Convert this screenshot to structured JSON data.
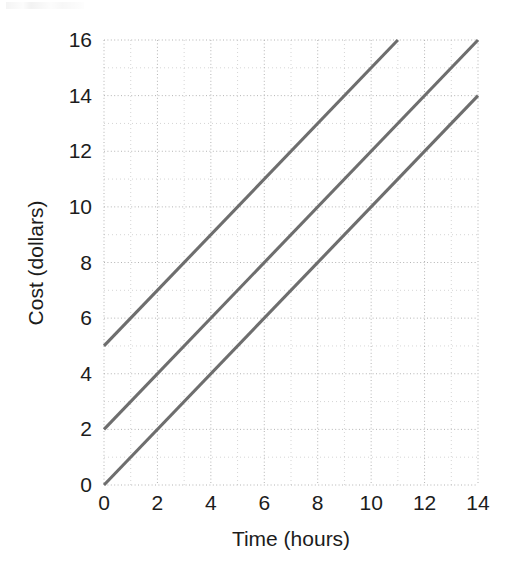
{
  "chart_data": {
    "type": "line",
    "title": "",
    "subtitle": "",
    "xlabel": "Time (hours)",
    "ylabel": "Cost (dollars)",
    "xlim": [
      0,
      14
    ],
    "ylim": [
      0,
      16
    ],
    "xticks": [
      0,
      2,
      4,
      6,
      8,
      10,
      12,
      14
    ],
    "yticks": [
      0,
      2,
      4,
      6,
      8,
      10,
      12,
      14,
      16
    ],
    "xtick_labels": [
      "0",
      "2",
      "4",
      "6",
      "8",
      "10",
      "12",
      "14"
    ],
    "ytick_labels": [
      "0",
      "2",
      "4",
      "6",
      "8",
      "10",
      "12",
      "14",
      "16"
    ],
    "grid": true,
    "grid_style": "dotted",
    "grid_minor_step_x": 1,
    "grid_minor_step_y": 1,
    "legend": false,
    "legend_position": "none",
    "line_color": "#6e6e6e",
    "grid_color": "#c9c9c9",
    "background": "#ffffff",
    "series": [
      {
        "name": "line-upper",
        "slope": 1,
        "intercept": 5,
        "x": [
          0,
          11
        ],
        "values": [
          5,
          16
        ],
        "points": [
          [
            0,
            5
          ],
          [
            11,
            16
          ]
        ]
      },
      {
        "name": "line-middle",
        "slope": 1,
        "intercept": 2,
        "x": [
          0,
          14
        ],
        "values": [
          2,
          16
        ],
        "points": [
          [
            0,
            2
          ],
          [
            14,
            16
          ]
        ]
      },
      {
        "name": "line-lower",
        "slope": 1,
        "intercept": 0,
        "x": [
          0,
          14
        ],
        "values": [
          0,
          14
        ],
        "points": [
          [
            0,
            0
          ],
          [
            14,
            14
          ]
        ]
      }
    ]
  },
  "figure": {
    "axis_x_title": "Time (hours)",
    "axis_y_title": "Cost (dollars)"
  }
}
